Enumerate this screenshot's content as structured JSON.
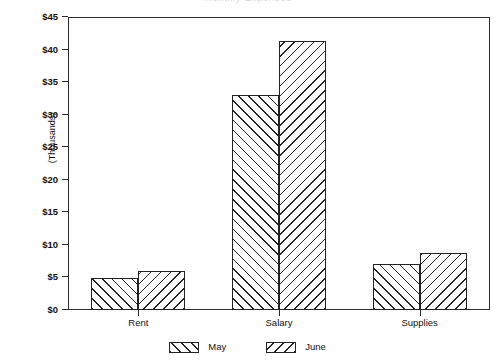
{
  "chart_data": {
    "type": "bar",
    "title": "",
    "title_remnant": "Monthly Expenses",
    "xlabel": "",
    "ylabel": "(Thousands)",
    "categories": [
      "Rent",
      "Salary",
      "Supplies"
    ],
    "series": [
      {
        "name": "May",
        "values": [
          4.9,
          33.0,
          7.1
        ]
      },
      {
        "name": "June",
        "values": [
          6.0,
          41.3,
          8.8
        ]
      }
    ],
    "ylim": [
      0,
      45
    ],
    "ytick_values": [
      0,
      5,
      10,
      15,
      20,
      25,
      30,
      35,
      40,
      45
    ],
    "ytick_labels": [
      "$0",
      "$5",
      "$10",
      "$15",
      "$20",
      "$25",
      "$30",
      "$35",
      "$40",
      "$45"
    ],
    "grid": false,
    "legend_position": "bottom-center",
    "series_patterns": [
      "forward-diagonal-hatch",
      "backward-diagonal-hatch"
    ],
    "colors": {
      "ink": "#222222",
      "axis": "#2b2b2b",
      "background": "#ffffff"
    }
  }
}
